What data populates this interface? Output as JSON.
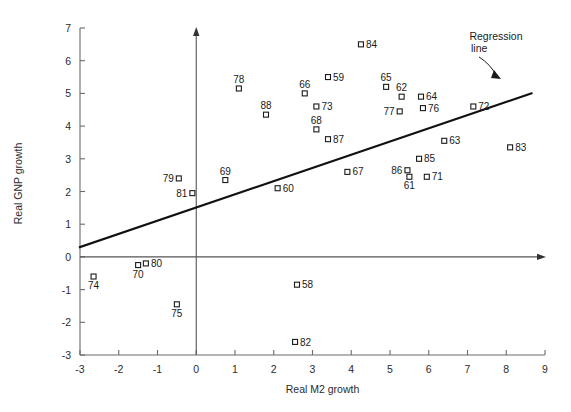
{
  "chart_data": {
    "type": "scatter",
    "title": "",
    "xlabel": "Real M2 growth",
    "ylabel": "Real GNP growth",
    "xlim": [
      -3,
      9
    ],
    "ylim": [
      -3,
      7
    ],
    "xticks": [
      "-3",
      "-2",
      "-1",
      "0",
      "1",
      "2",
      "3",
      "4",
      "5",
      "6",
      "7",
      "8",
      "9"
    ],
    "yticks": [
      "-3",
      "-2",
      "-1",
      "0",
      "1",
      "2",
      "3",
      "4",
      "5",
      "6",
      "7"
    ],
    "grid": false,
    "legend": "none",
    "annotations": [
      {
        "name": "regression-line-annotation",
        "text": "Regression\nline",
        "line1": "Regression",
        "line2": "line"
      }
    ],
    "regression_line": {
      "x_start": -3.0,
      "y_start": 0.3,
      "x_end": 8.65,
      "y_end": 5.0,
      "slope": 0.4,
      "intercept": 1.5
    },
    "point_label_key": "year (two digits)",
    "points": [
      {
        "label": "58",
        "x": 2.6,
        "y": -0.85,
        "label_pos": "right"
      },
      {
        "label": "59",
        "x": 3.4,
        "y": 5.5,
        "label_pos": "right"
      },
      {
        "label": "60",
        "x": 2.1,
        "y": 2.1,
        "label_pos": "right"
      },
      {
        "label": "61",
        "x": 5.5,
        "y": 2.45,
        "label_pos": "below"
      },
      {
        "label": "62",
        "x": 5.3,
        "y": 4.9,
        "label_pos": "above"
      },
      {
        "label": "63",
        "x": 6.4,
        "y": 3.55,
        "label_pos": "right"
      },
      {
        "label": "64",
        "x": 5.8,
        "y": 4.9,
        "label_pos": "right"
      },
      {
        "label": "65",
        "x": 4.9,
        "y": 5.2,
        "label_pos": "above"
      },
      {
        "label": "66",
        "x": 2.8,
        "y": 5.0,
        "label_pos": "above"
      },
      {
        "label": "67",
        "x": 3.9,
        "y": 2.6,
        "label_pos": "right"
      },
      {
        "label": "68",
        "x": 3.1,
        "y": 3.9,
        "label_pos": "above"
      },
      {
        "label": "69",
        "x": 0.75,
        "y": 2.35,
        "label_pos": "above"
      },
      {
        "label": "70",
        "x": -1.5,
        "y": -0.25,
        "label_pos": "below"
      },
      {
        "label": "71",
        "x": 5.95,
        "y": 2.45,
        "label_pos": "right"
      },
      {
        "label": "72",
        "x": 7.15,
        "y": 4.6,
        "label_pos": "right"
      },
      {
        "label": "73",
        "x": 3.1,
        "y": 4.6,
        "label_pos": "right"
      },
      {
        "label": "74",
        "x": -2.65,
        "y": -0.6,
        "label_pos": "below"
      },
      {
        "label": "75",
        "x": -0.5,
        "y": -1.45,
        "label_pos": "below"
      },
      {
        "label": "76",
        "x": 5.85,
        "y": 4.55,
        "label_pos": "right"
      },
      {
        "label": "77",
        "x": 5.25,
        "y": 4.45,
        "label_pos": "left"
      },
      {
        "label": "78",
        "x": 1.1,
        "y": 5.15,
        "label_pos": "above"
      },
      {
        "label": "79",
        "x": -0.45,
        "y": 2.4,
        "label_pos": "left"
      },
      {
        "label": "80",
        "x": -1.3,
        "y": -0.2,
        "label_pos": "right"
      },
      {
        "label": "81",
        "x": -0.1,
        "y": 1.95,
        "label_pos": "left"
      },
      {
        "label": "82",
        "x": 2.55,
        "y": -2.6,
        "label_pos": "right"
      },
      {
        "label": "83",
        "x": 8.1,
        "y": 3.35,
        "label_pos": "right"
      },
      {
        "label": "84",
        "x": 4.25,
        "y": 6.5,
        "label_pos": "right"
      },
      {
        "label": "85",
        "x": 5.75,
        "y": 3.0,
        "label_pos": "right"
      },
      {
        "label": "86",
        "x": 5.45,
        "y": 2.65,
        "label_pos": "left"
      },
      {
        "label": "87",
        "x": 3.4,
        "y": 3.6,
        "label_pos": "right"
      },
      {
        "label": "88",
        "x": 1.8,
        "y": 4.35,
        "label_pos": "above"
      }
    ]
  }
}
